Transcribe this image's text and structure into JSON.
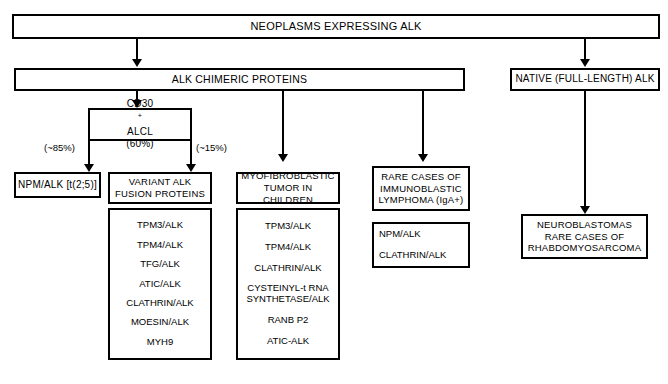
{
  "diagram": {
    "root": {
      "label": "NEOPLASMS  EXPRESSING  ALK"
    },
    "branches": {
      "chimeric": {
        "label": "ALK CHIMERIC PROTEINS"
      },
      "native": {
        "label": "NATIVE (FULL-LENGTH) ALK"
      }
    },
    "alcl": {
      "line1_prefix": "CD30",
      "line1_sup": "+",
      "line1_suffix": " ALCL",
      "line2": "(60%)",
      "left_pct": "(~85%)",
      "right_pct": "(~15%)"
    },
    "columns": {
      "npm": {
        "header": "NPM/ALK [t(2;5)]"
      },
      "variant": {
        "header_line1": "VARIANT ALK",
        "header_line2": "FUSION PROTEINS",
        "items": [
          "TPM3/ALK",
          "TPM4/ALK",
          "TFG/ALK",
          "ATIC/ALK",
          "CLATHRIN/ALK",
          "MOESIN/ALK",
          "MYH9"
        ]
      },
      "myofibroblastic": {
        "header_line1": "MYOFIBROBLASTIC",
        "header_line2": "TUMOR IN CHILDREN",
        "items": [
          "TPM3/ALK",
          "TPM4/ALK",
          "CLATHRIN/ALK",
          "CYSTEINYL-t RNA",
          "SYNTHETASE/ALK",
          "RANB P2",
          "ATIC-ALK"
        ]
      },
      "immunoblastic": {
        "header_line1": "RARE CASES OF",
        "header_line2": "IMMUNOBLASTIC",
        "header_line3": "LYMPHOMA (IgA+)",
        "items": [
          "NPM/ALK",
          "CLATHRIN/ALK"
        ]
      },
      "neuroblastoma": {
        "line1": "NEUROBLASTOMAS",
        "line2": "RARE CASES OF",
        "line3": "RHABDOMYOSARCOMA"
      }
    }
  }
}
